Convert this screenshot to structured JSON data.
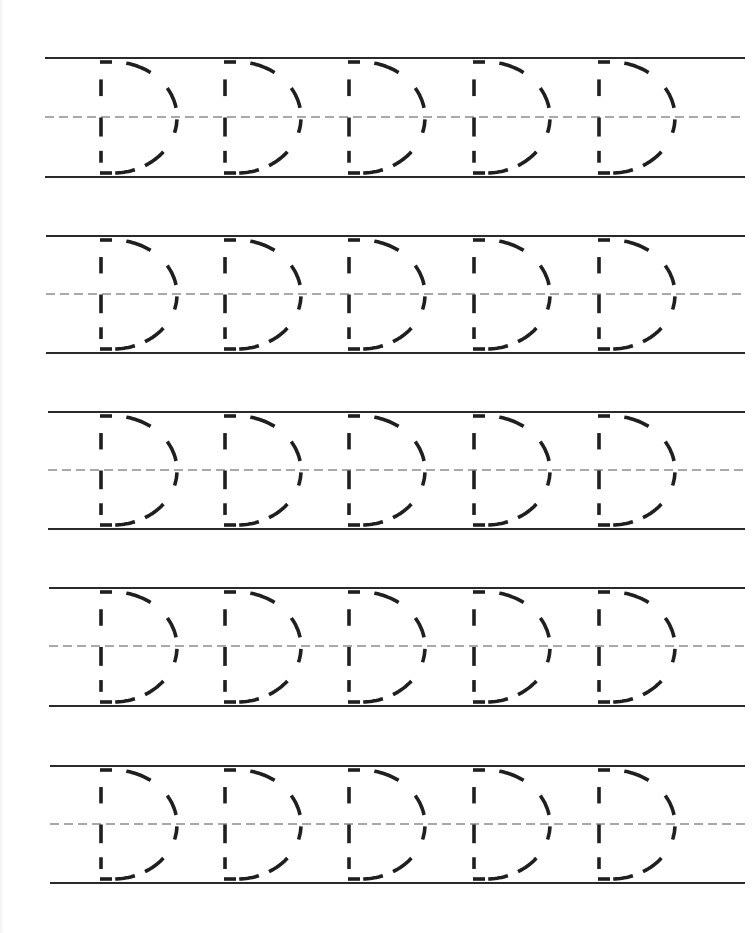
{
  "worksheet": {
    "letter": "D",
    "letter_case": "uppercase",
    "style": "dashed-trace",
    "letters_per_row": 5,
    "colors": {
      "background": "#ffffff",
      "rule_line": "#2a2a2a",
      "midline": "#555555",
      "letter_dash": "#1f1f1f"
    },
    "rows": [
      {
        "top": 58,
        "mid": 117,
        "bottom": 177,
        "x_start": 45,
        "x_end": 745
      },
      {
        "top": 236,
        "mid": 294,
        "bottom": 353,
        "x_start": 46,
        "x_end": 745
      },
      {
        "top": 412,
        "mid": 470,
        "bottom": 529,
        "x_start": 48,
        "x_end": 745
      },
      {
        "top": 588,
        "mid": 646,
        "bottom": 706,
        "x_start": 49,
        "x_end": 745
      },
      {
        "top": 766,
        "mid": 824,
        "bottom": 883,
        "x_start": 50,
        "x_end": 745
      }
    ],
    "letter_x_positions": [
      101,
      225,
      349,
      474,
      599
    ]
  }
}
